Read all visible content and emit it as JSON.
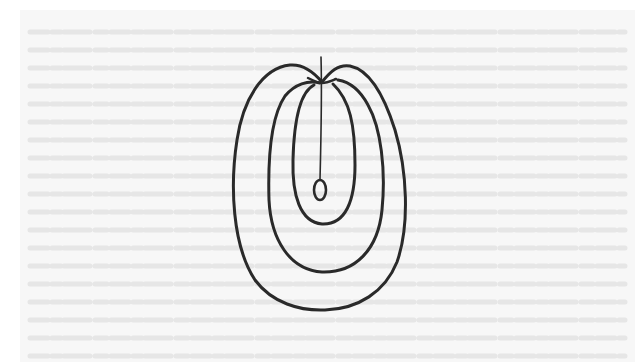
{
  "image": {
    "description": "Scanned line drawing of nested egg-shaped (ovoid) contours with a central stalk ending in a small oval, on faintly textured paper with bleed-through text lines",
    "width": 635,
    "height": 362
  },
  "colors": {
    "margin": "#ffffff",
    "paper": "#f7f7f7",
    "bleed_through": "#e6e6e6",
    "ink": "#2a2a2a"
  },
  "drawing": {
    "outer_contour": {
      "left": 232,
      "right": 405,
      "top": 65,
      "bottom": 310
    },
    "middle_contour": {
      "left": 268,
      "right": 383,
      "top": 80,
      "bottom": 272
    },
    "inner_contour": {
      "left": 292,
      "right": 355,
      "top": 84,
      "bottom": 224
    },
    "notch": {
      "x": 322,
      "y": 82
    },
    "stalk": {
      "x1": 321,
      "y1": 57,
      "x2": 320,
      "y2": 180
    },
    "terminal_oval": {
      "cx": 320,
      "cy": 190,
      "rx": 6,
      "ry": 10
    }
  },
  "bleed_lines": [
    22,
    40,
    58,
    76,
    94,
    112,
    130,
    148,
    166,
    184,
    202,
    220,
    238,
    256,
    274,
    292,
    310,
    328,
    346
  ]
}
